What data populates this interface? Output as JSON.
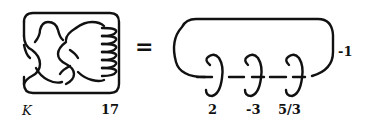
{
  "diagram": {
    "left_panel": {
      "knot_label": "K",
      "twist_label": "17"
    },
    "equals_sign": "=",
    "right_panel": {
      "outer_loop_label": "-1",
      "components": [
        {
          "label": "2"
        },
        {
          "label": "-3"
        },
        {
          "label": "5/3"
        }
      ]
    },
    "colors": {
      "stroke": "#111111",
      "background": "#ffffff"
    }
  }
}
